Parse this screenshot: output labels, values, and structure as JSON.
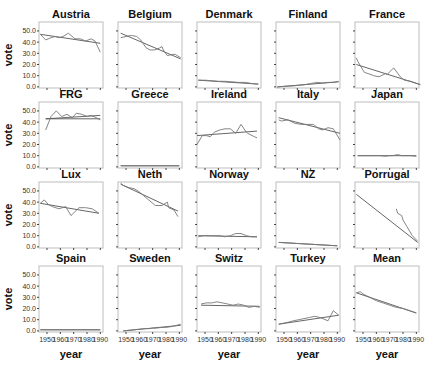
{
  "chart_data": {
    "type": "line",
    "layout": {
      "rows": 4,
      "cols": 5,
      "grid": false,
      "legend": "none"
    },
    "xlabel": "year",
    "ylabel": "vote",
    "x_ticks": [
      1950,
      1960,
      1970,
      1980,
      1990
    ],
    "x_tick_labels": [
      "1950",
      "1960",
      "1970",
      "1980",
      "1990"
    ],
    "y_ticks": [
      0,
      10,
      20,
      30,
      40,
      50
    ],
    "y_tick_labels": [
      "0.0",
      "10.0",
      "20.0",
      "30.0",
      "40.0",
      "50.0"
    ],
    "ylim": [
      -1,
      58
    ],
    "xlim": [
      1944,
      1992
    ],
    "series_names": [
      "observed",
      "linear fit"
    ],
    "panels": [
      {
        "title": "Austria",
        "observed": [
          [
            1945,
            47
          ],
          [
            1949,
            42
          ],
          [
            1953,
            44
          ],
          [
            1956,
            45
          ],
          [
            1959,
            44
          ],
          [
            1962,
            45
          ],
          [
            1966,
            48
          ],
          [
            1970,
            44
          ],
          [
            1971,
            43
          ],
          [
            1975,
            43
          ],
          [
            1979,
            41
          ],
          [
            1983,
            43
          ],
          [
            1986,
            41
          ],
          [
            1990,
            31
          ]
        ],
        "fit": [
          [
            1945,
            47
          ],
          [
            1990,
            39
          ]
        ]
      },
      {
        "title": "Belgium",
        "observed": [
          [
            1946,
            44
          ],
          [
            1950,
            45
          ],
          [
            1954,
            46
          ],
          [
            1958,
            45
          ],
          [
            1961,
            42
          ],
          [
            1965,
            35
          ],
          [
            1968,
            33
          ],
          [
            1971,
            33
          ],
          [
            1974,
            34
          ],
          [
            1977,
            36
          ],
          [
            1978,
            33
          ],
          [
            1981,
            28
          ],
          [
            1985,
            29
          ],
          [
            1987,
            29
          ],
          [
            1991,
            26
          ]
        ],
        "fit": [
          [
            1946,
            48
          ],
          [
            1991,
            25
          ]
        ]
      },
      {
        "title": "Denmark",
        "observed": [
          [
            1945,
            6
          ],
          [
            1950,
            6
          ],
          [
            1955,
            5.5
          ],
          [
            1960,
            5
          ],
          [
            1965,
            5
          ],
          [
            1970,
            4.5
          ],
          [
            1975,
            4
          ],
          [
            1980,
            4
          ],
          [
            1985,
            3
          ],
          [
            1990,
            2.5
          ]
        ],
        "fit": [
          [
            1945,
            6
          ],
          [
            1990,
            2.5
          ]
        ]
      },
      {
        "title": "Finland",
        "observed": [
          [
            1945,
            0
          ],
          [
            1951,
            0.5
          ],
          [
            1958,
            1
          ],
          [
            1962,
            1.5
          ],
          [
            1966,
            2
          ],
          [
            1970,
            3
          ],
          [
            1975,
            4
          ],
          [
            1979,
            3.5
          ],
          [
            1983,
            4
          ],
          [
            1987,
            4
          ],
          [
            1991,
            5
          ]
        ],
        "fit": [
          [
            1945,
            0
          ],
          [
            1991,
            4.5
          ]
        ]
      },
      {
        "title": "France",
        "observed": [
          [
            1945,
            26
          ],
          [
            1946,
            23
          ],
          [
            1951,
            13
          ],
          [
            1956,
            11
          ],
          [
            1958,
            10
          ],
          [
            1962,
            9
          ],
          [
            1967,
            12
          ],
          [
            1968,
            11
          ],
          [
            1973,
            17
          ],
          [
            1978,
            9
          ],
          [
            1981,
            6
          ],
          [
            1986,
            5
          ],
          [
            1988,
            4
          ],
          [
            1993,
            2
          ]
        ],
        "fit": [
          [
            1945,
            20
          ],
          [
            1993,
            2
          ]
        ]
      },
      {
        "title": "FRG",
        "observed": [
          [
            1949,
            33
          ],
          [
            1953,
            45
          ],
          [
            1957,
            50
          ],
          [
            1961,
            45
          ],
          [
            1965,
            47
          ],
          [
            1969,
            44
          ],
          [
            1972,
            48
          ],
          [
            1976,
            47
          ],
          [
            1980,
            45
          ],
          [
            1983,
            46
          ],
          [
            1987,
            44
          ],
          [
            1990,
            42
          ]
        ],
        "fit": [
          [
            1949,
            43
          ],
          [
            1990,
            46
          ]
        ],
        "fit_extra": [
          [
            1949,
            43
          ],
          [
            1990,
            43
          ]
        ]
      },
      {
        "title": "Greece",
        "observed": [
          [
            1946,
            1
          ],
          [
            1990,
            1
          ]
        ],
        "fit": [
          [
            1946,
            1
          ],
          [
            1990,
            1
          ]
        ]
      },
      {
        "title": "Ireland",
        "observed": [
          [
            1944,
            20
          ],
          [
            1948,
            28
          ],
          [
            1951,
            28
          ],
          [
            1954,
            27
          ],
          [
            1957,
            31
          ],
          [
            1961,
            33
          ],
          [
            1965,
            34
          ],
          [
            1969,
            34
          ],
          [
            1973,
            30
          ],
          [
            1977,
            38
          ],
          [
            1981,
            31
          ],
          [
            1982,
            30
          ],
          [
            1987,
            27
          ],
          [
            1989,
            26
          ]
        ],
        "fit": [
          [
            1944,
            28
          ],
          [
            1989,
            32
          ]
        ]
      },
      {
        "title": "Italy",
        "observed": [
          [
            1946,
            42
          ],
          [
            1948,
            41
          ],
          [
            1953,
            42
          ],
          [
            1958,
            39
          ],
          [
            1963,
            38
          ],
          [
            1968,
            38
          ],
          [
            1972,
            38
          ],
          [
            1976,
            34
          ],
          [
            1979,
            33
          ],
          [
            1983,
            35
          ],
          [
            1987,
            34
          ],
          [
            1992,
            24
          ]
        ],
        "fit": [
          [
            1946,
            44
          ],
          [
            1992,
            30
          ]
        ]
      },
      {
        "title": "Japan",
        "observed": [
          [
            1946,
            10
          ],
          [
            1960,
            10
          ],
          [
            1963,
            10
          ],
          [
            1967,
            9.5
          ],
          [
            1969,
            10
          ],
          [
            1972,
            10
          ],
          [
            1976,
            11
          ],
          [
            1979,
            10
          ],
          [
            1980,
            10
          ],
          [
            1983,
            10
          ],
          [
            1986,
            10
          ],
          [
            1990,
            9.5
          ]
        ],
        "fit": [
          [
            1946,
            10
          ],
          [
            1990,
            10
          ]
        ]
      },
      {
        "title": "Lux",
        "observed": [
          [
            1945,
            39
          ],
          [
            1948,
            42
          ],
          [
            1951,
            38
          ],
          [
            1954,
            36
          ],
          [
            1959,
            34
          ],
          [
            1964,
            36
          ],
          [
            1968,
            28
          ],
          [
            1974,
            35
          ],
          [
            1979,
            35
          ],
          [
            1984,
            34
          ],
          [
            1989,
            30
          ]
        ],
        "fit": [
          [
            1945,
            39
          ],
          [
            1989,
            30
          ]
        ]
      },
      {
        "title": "Neth",
        "observed": [
          [
            1946,
            57
          ],
          [
            1948,
            55
          ],
          [
            1952,
            53
          ],
          [
            1956,
            52
          ],
          [
            1959,
            50
          ],
          [
            1963,
            46
          ],
          [
            1967,
            42
          ],
          [
            1971,
            38
          ],
          [
            1972,
            37
          ],
          [
            1977,
            37
          ],
          [
            1981,
            40
          ],
          [
            1982,
            35
          ],
          [
            1986,
            33
          ],
          [
            1989,
            27
          ]
        ],
        "fit": [
          [
            1946,
            56
          ],
          [
            1989,
            32
          ]
        ]
      },
      {
        "title": "Norway",
        "observed": [
          [
            1945,
            9
          ],
          [
            1949,
            10
          ],
          [
            1953,
            10
          ],
          [
            1957,
            10
          ],
          [
            1961,
            10
          ],
          [
            1965,
            9
          ],
          [
            1969,
            10
          ],
          [
            1973,
            12
          ],
          [
            1977,
            12
          ],
          [
            1981,
            10
          ],
          [
            1985,
            9
          ],
          [
            1989,
            9
          ]
        ],
        "fit": [
          [
            1945,
            10
          ],
          [
            1989,
            9
          ]
        ]
      },
      {
        "title": "NZ",
        "observed": [
          [
            1946,
            4
          ],
          [
            1990,
            1
          ]
        ],
        "fit": [
          [
            1946,
            4
          ],
          [
            1990,
            1
          ]
        ]
      },
      {
        "title": "Porrugal",
        "observed": [
          [
            1975,
            34
          ],
          [
            1976,
            30
          ],
          [
            1979,
            28
          ],
          [
            1980,
            24
          ],
          [
            1983,
            18
          ],
          [
            1985,
            14
          ],
          [
            1987,
            10
          ],
          [
            1991,
            5
          ]
        ],
        "fit": [
          [
            1945,
            47
          ],
          [
            1991,
            4
          ]
        ]
      },
      {
        "title": "Spain",
        "observed": [
          [
            1945,
            1
          ],
          [
            1990,
            1
          ]
        ],
        "fit": [
          [
            1945,
            1
          ],
          [
            1990,
            1
          ]
        ]
      },
      {
        "title": "Sweden",
        "observed": [
          [
            1948,
            0
          ],
          [
            1952,
            0.5
          ],
          [
            1956,
            1
          ],
          [
            1960,
            1.5
          ],
          [
            1964,
            2
          ],
          [
            1968,
            2
          ],
          [
            1970,
            2.5
          ],
          [
            1973,
            2.5
          ],
          [
            1976,
            3
          ],
          [
            1979,
            3
          ],
          [
            1982,
            3.5
          ],
          [
            1985,
            4
          ],
          [
            1988,
            5
          ],
          [
            1991,
            6
          ]
        ],
        "fit": [
          [
            1948,
            0
          ],
          [
            1991,
            5
          ]
        ]
      },
      {
        "title": "Switz",
        "observed": [
          [
            1947,
            24
          ],
          [
            1951,
            25
          ],
          [
            1955,
            25
          ],
          [
            1959,
            26
          ],
          [
            1963,
            25
          ],
          [
            1967,
            24
          ],
          [
            1971,
            23
          ],
          [
            1975,
            24
          ],
          [
            1979,
            23
          ],
          [
            1983,
            21
          ],
          [
            1987,
            22
          ],
          [
            1991,
            21
          ]
        ],
        "fit": [
          [
            1947,
            23
          ],
          [
            1991,
            22
          ]
        ]
      },
      {
        "title": "Turkey",
        "observed": [
          [
            1946,
            6
          ],
          [
            1950,
            7
          ],
          [
            1954,
            8
          ],
          [
            1957,
            9
          ],
          [
            1961,
            10
          ],
          [
            1965,
            11
          ],
          [
            1969,
            12
          ],
          [
            1973,
            13
          ],
          [
            1977,
            12
          ],
          [
            1983,
            9
          ],
          [
            1987,
            18
          ],
          [
            1991,
            14
          ]
        ],
        "fit": [
          [
            1946,
            6
          ],
          [
            1991,
            14
          ]
        ],
        "note": "observed series begins ~1969 and spikes ~1987"
      },
      {
        "title": "Mean",
        "observed": [
          [
            1945,
            34
          ],
          [
            1948,
            35
          ],
          [
            1950,
            33
          ],
          [
            1955,
            30
          ],
          [
            1960,
            27
          ],
          [
            1965,
            25
          ],
          [
            1970,
            23
          ],
          [
            1975,
            21
          ],
          [
            1980,
            20
          ],
          [
            1985,
            18
          ],
          [
            1990,
            16
          ]
        ],
        "fit": [
          [
            1945,
            34
          ],
          [
            1990,
            16
          ]
        ]
      }
    ]
  }
}
